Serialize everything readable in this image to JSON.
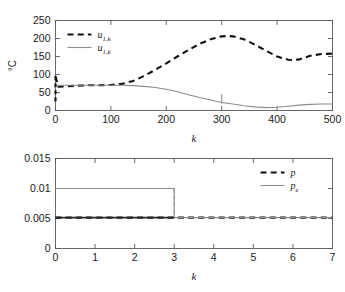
{
  "figure": {
    "background": "#ffffff",
    "panels": 2
  },
  "chart_data": [
    {
      "type": "line",
      "panel": "top",
      "title": "",
      "xlabel": "k",
      "ylabel": "°C",
      "xlim": [
        0,
        500
      ],
      "ylim": [
        0,
        250
      ],
      "xticks": [
        0,
        100,
        200,
        300,
        400,
        500
      ],
      "yticks": [
        0,
        50,
        100,
        150,
        200,
        250
      ],
      "xtick_labels": [
        "0",
        "100",
        "200",
        "300",
        "400",
        "500"
      ],
      "ytick_labels": [
        "0",
        "50",
        "100",
        "150",
        "200",
        "250"
      ],
      "grid": false,
      "legend_position": "upper-left",
      "series": [
        {
          "name": "u_{1,k}",
          "label_base": "u",
          "label_sub": "1,k",
          "style": "dashed",
          "color": "#111111",
          "width": 2.1,
          "x": [
            0,
            5,
            20,
            40,
            60,
            80,
            100,
            120,
            140,
            160,
            180,
            200,
            220,
            240,
            260,
            280,
            300,
            310,
            320,
            340,
            360,
            380,
            400,
            420,
            430,
            440,
            460,
            480,
            500
          ],
          "y": [
            95,
            66,
            67,
            69,
            70,
            70,
            71,
            74,
            82,
            96,
            113,
            131,
            150,
            168,
            185,
            198,
            206,
            207,
            206,
            198,
            183,
            166,
            150,
            141,
            140,
            142,
            152,
            157,
            158
          ]
        },
        {
          "name": "u_{1,k}",
          "label_base": "u",
          "label_sub": "1,k",
          "style": "solid",
          "color": "#8c8c8c",
          "width": 1.1,
          "x": [
            0,
            20,
            40,
            60,
            80,
            100,
            120,
            140,
            160,
            180,
            200,
            220,
            240,
            260,
            280,
            300,
            310,
            320,
            340,
            360,
            380,
            400,
            420,
            440,
            460,
            480,
            500
          ],
          "y": [
            70,
            70,
            70,
            70,
            70,
            70,
            70,
            69,
            67,
            64,
            59,
            52,
            44,
            36,
            29,
            22,
            20,
            18,
            13,
            10,
            8,
            9,
            12,
            15,
            17,
            18,
            18
          ]
        }
      ],
      "annotations": [
        {
          "name": "left-edge-dashed-drop",
          "x": 0,
          "y_from": 95,
          "y_to": 20,
          "style": "dashed",
          "color": "#111111"
        },
        {
          "name": "gray-drop-at-300",
          "x": 300,
          "y_from": 45,
          "y_to": 20,
          "style": "solid",
          "color": "#8c8c8c"
        }
      ]
    },
    {
      "type": "line",
      "panel": "bottom",
      "title": "",
      "xlabel": "k",
      "ylabel": "",
      "xlim": [
        0,
        7
      ],
      "ylim": [
        0,
        0.015
      ],
      "xticks": [
        0,
        1,
        2,
        3,
        4,
        5,
        6,
        7
      ],
      "yticks": [
        0,
        0.005,
        0.01,
        0.015
      ],
      "xtick_labels": [
        "0",
        "1",
        "2",
        "3",
        "4",
        "5",
        "6",
        "7"
      ],
      "ytick_labels": [
        "0",
        "0.005",
        "0.01",
        "0.015"
      ],
      "grid": false,
      "legend_position": "upper-right",
      "series": [
        {
          "name": "p",
          "label_base": "p",
          "label_sub": "",
          "style": "dashed",
          "color": "#111111",
          "width": 2.1,
          "x": [
            0,
            3,
            3,
            7
          ],
          "y": [
            0.00515,
            0.00515,
            0.00515,
            0.00515
          ]
        },
        {
          "name": "p_e",
          "label_base": "p",
          "label_sub": "e",
          "style": "solid",
          "color": "#8c8c8c",
          "width": 1.1,
          "x": [
            0,
            3,
            3,
            7
          ],
          "y": [
            0.01,
            0.01,
            0.00515,
            0.00515
          ]
        }
      ],
      "annotations": [
        {
          "name": "solid-black-segment",
          "x_from": 0,
          "x_to": 3,
          "y": 0.00515,
          "style": "solid",
          "color": "#2b2b2b"
        },
        {
          "name": "gray-step-down",
          "x": 3,
          "y_from": 0.01,
          "y_to": 0.00515,
          "style": "dashed",
          "color": "#8c8c8c"
        }
      ]
    }
  ]
}
